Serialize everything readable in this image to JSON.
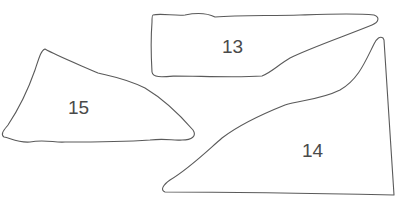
{
  "diagram": {
    "stroke_color": "#5a5a5a",
    "label_color": "#4a4a4a",
    "background": "#ffffff",
    "shapes": [
      {
        "id": "13",
        "label": "13"
      },
      {
        "id": "14",
        "label": "14"
      },
      {
        "id": "15",
        "label": "15"
      }
    ]
  }
}
